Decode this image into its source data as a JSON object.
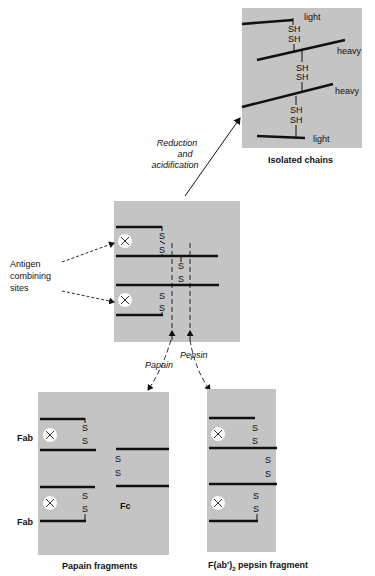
{
  "diagram": {
    "type": "antibody-fragmentation",
    "colors": {
      "panel": "#c4c4c4",
      "line": "#111111",
      "background": "#ffffff",
      "site": "#ffffff"
    },
    "isolated_chains": {
      "caption": "Isolated chains",
      "labels": [
        "light",
        "heavy",
        "heavy",
        "light"
      ],
      "sh_pairs": [
        [
          "SH",
          "SH"
        ],
        [
          "SH",
          "SH"
        ],
        [
          "SH",
          "SH"
        ]
      ]
    },
    "reduction_arrow": {
      "line1": "Reduction",
      "line2": "and",
      "line3": "acidification"
    },
    "intact_antibody": {
      "annotation_line1": "Antigen",
      "annotation_line2": "combining",
      "annotation_line3": "sites",
      "disulfide_label": "S",
      "site_symbol": "×"
    },
    "enzyme_labels": {
      "papain": "Papain",
      "pepsin": "Pepsin"
    },
    "papain_fragments": {
      "caption": "Papain fragments",
      "fab_top": "Fab",
      "fab_bottom": "Fab",
      "fc": "Fc"
    },
    "pepsin_fragment": {
      "caption_main": "F(ab')",
      "caption_sub": "2",
      "caption_rest": " pepsin fragment"
    }
  }
}
